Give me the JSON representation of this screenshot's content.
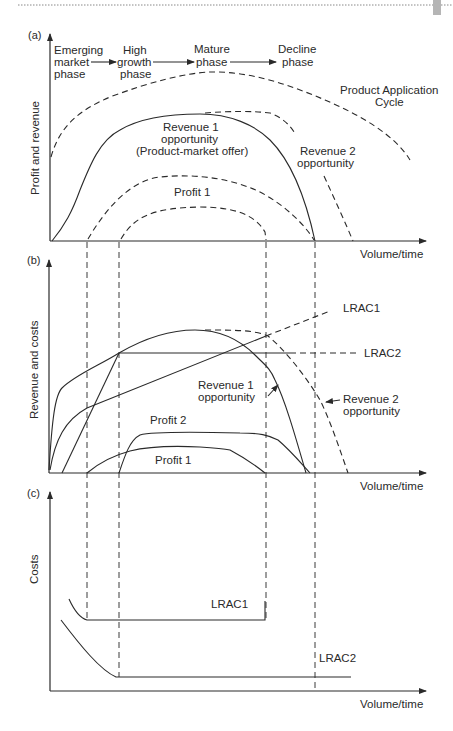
{
  "header": {
    "rule_color": "#888888",
    "tab_color": "#b5b5b5"
  },
  "panel_a": {
    "label": "(a)",
    "ylabel": "Profit and revenue",
    "xlabel": "Volume/time",
    "phases": [
      {
        "line1": "Emerging",
        "line2": "market",
        "line3": "phase"
      },
      {
        "line1": "High",
        "line2": "growth",
        "line3": "phase"
      },
      {
        "line1": "Mature",
        "line2": "phase"
      },
      {
        "line1": "Decline",
        "line2": "phase"
      }
    ],
    "curves": {
      "pac": {
        "line1": "Product Application",
        "line2": "Cycle"
      },
      "revenue1": {
        "line1": "Revenue 1",
        "line2": "opportunity",
        "line3": "(Product-market offer)"
      },
      "revenue2": {
        "line1": "Revenue 2",
        "line2": "opportunity"
      },
      "profit1": "Profit 1"
    }
  },
  "panel_b": {
    "label": "(b)",
    "ylabel": "Revenue and costs",
    "xlabel": "Volume/time",
    "curves": {
      "lrac1": "LRAC1",
      "lrac2": "LRAC2",
      "revenue1": {
        "line1": "Revenue 1",
        "line2": "opportunity"
      },
      "revenue2": {
        "line1": "Revenue 2",
        "line2": "opportunity"
      },
      "profit2": "Profit 2",
      "profit1": "Profit 1"
    }
  },
  "panel_c": {
    "label": "(c)",
    "ylabel": "Costs",
    "xlabel": "Volume/time",
    "curves": {
      "lrac1": "LRAC1",
      "lrac2": "LRAC2"
    }
  }
}
